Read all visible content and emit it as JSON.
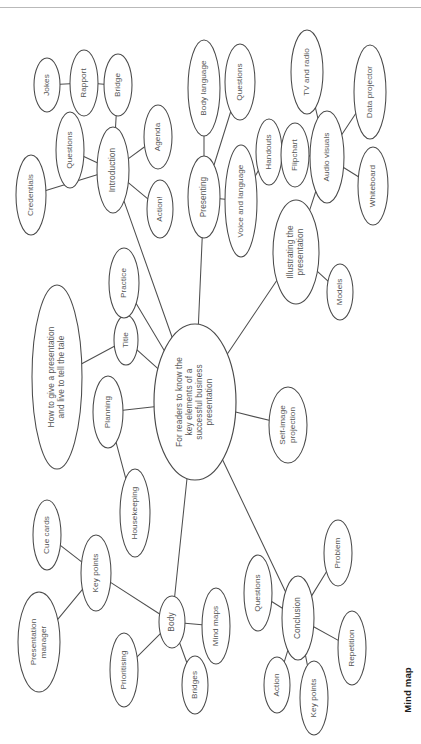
{
  "figure": {
    "caption": "Mind map",
    "rotation_note": "page content rotated 90 degrees",
    "colors": {
      "background": "#ffffff",
      "stroke": "#4a4a4a",
      "text": "#555555",
      "caption_text": "#1d1d1d",
      "rule": "#b9b9b9"
    }
  },
  "mind_map": {
    "central_topic": "For readers to know the key elements of a successful business presentation",
    "nodes": [
      {
        "id": "center",
        "label": "For readers to know the\nkey elements of a\nsuccessful business\npresentation",
        "cx": 195,
        "cy": 402,
        "rx": 41,
        "ry": 78,
        "kind": "central"
      },
      {
        "id": "howto",
        "label": "How to give a presentation\nand live to tell the tale",
        "cx": 57,
        "cy": 377,
        "rx": 25,
        "ry": 92,
        "kind": "major"
      },
      {
        "id": "title",
        "label": "Title",
        "cx": 126,
        "cy": 340,
        "rx": 12,
        "ry": 25,
        "kind": "leaf"
      },
      {
        "id": "practice",
        "label": "Practice",
        "cx": 124,
        "cy": 283,
        "rx": 15,
        "ry": 35,
        "kind": "leaf"
      },
      {
        "id": "planning",
        "label": "Planning",
        "cx": 108,
        "cy": 412,
        "rx": 15,
        "ry": 36,
        "kind": "leaf"
      },
      {
        "id": "housekeeping",
        "label": "Housekeeping",
        "cx": 135,
        "cy": 513,
        "rx": 15,
        "ry": 44,
        "kind": "leaf"
      },
      {
        "id": "introduction",
        "label": "Introduction",
        "cx": 113,
        "cy": 170,
        "rx": 16,
        "ry": 43,
        "kind": "major"
      },
      {
        "id": "bridge",
        "label": "Bridge",
        "cx": 118,
        "cy": 85,
        "rx": 14,
        "ry": 31,
        "kind": "leaf"
      },
      {
        "id": "rapport",
        "label": "Rapport",
        "cx": 84,
        "cy": 83,
        "rx": 14,
        "ry": 33,
        "kind": "leaf"
      },
      {
        "id": "jokes",
        "label": "Jokes",
        "cx": 47,
        "cy": 85,
        "rx": 13,
        "ry": 27,
        "kind": "leaf"
      },
      {
        "id": "questions-intro",
        "label": "Questions",
        "cx": 70,
        "cy": 150,
        "rx": 14,
        "ry": 38,
        "kind": "leaf"
      },
      {
        "id": "credentials",
        "label": "Credentials",
        "cx": 31,
        "cy": 195,
        "rx": 15,
        "ry": 40,
        "kind": "leaf"
      },
      {
        "id": "agenda",
        "label": "Agenda",
        "cx": 158,
        "cy": 137,
        "rx": 14,
        "ry": 32,
        "kind": "leaf"
      },
      {
        "id": "action-intro",
        "label": "Action!",
        "cx": 160,
        "cy": 209,
        "rx": 13,
        "ry": 29,
        "kind": "leaf"
      },
      {
        "id": "presenting",
        "label": "Presenting",
        "cx": 204,
        "cy": 197,
        "rx": 16,
        "ry": 41,
        "kind": "major"
      },
      {
        "id": "body-language",
        "label": "Body language",
        "cx": 204,
        "cy": 88,
        "rx": 16,
        "ry": 48,
        "kind": "leaf"
      },
      {
        "id": "questions-present",
        "label": "Questions",
        "cx": 240,
        "cy": 82,
        "rx": 15,
        "ry": 38,
        "kind": "leaf"
      },
      {
        "id": "voice",
        "label": "Voice and language",
        "cx": 241,
        "cy": 201,
        "rx": 16,
        "ry": 56,
        "kind": "leaf"
      },
      {
        "id": "handouts",
        "label": "Handouts",
        "cx": 269,
        "cy": 152,
        "rx": 13,
        "ry": 33,
        "kind": "leaf"
      },
      {
        "id": "illustrating",
        "label": "Illustrating the\npresentation",
        "cx": 296,
        "cy": 252,
        "rx": 23,
        "ry": 52,
        "kind": "major"
      },
      {
        "id": "models",
        "label": "Models",
        "cx": 340,
        "cy": 292,
        "rx": 13,
        "ry": 28,
        "kind": "leaf"
      },
      {
        "id": "audio-visuals",
        "label": "Audio visuals",
        "cx": 327,
        "cy": 157,
        "rx": 17,
        "ry": 46,
        "kind": "leaf"
      },
      {
        "id": "flipchart",
        "label": "Flipchart",
        "cx": 295,
        "cy": 155,
        "rx": 14,
        "ry": 32,
        "kind": "leaf"
      },
      {
        "id": "tv-radio",
        "label": "TV and radio",
        "cx": 307,
        "cy": 72,
        "rx": 16,
        "ry": 42,
        "kind": "leaf"
      },
      {
        "id": "data-projector",
        "label": "Data projector",
        "cx": 370,
        "cy": 92,
        "rx": 16,
        "ry": 47,
        "kind": "leaf"
      },
      {
        "id": "whiteboard",
        "label": "Whiteboard",
        "cx": 373,
        "cy": 186,
        "rx": 15,
        "ry": 39,
        "kind": "leaf"
      },
      {
        "id": "self-image",
        "label": "Self-image\nprojection",
        "cx": 288,
        "cy": 425,
        "rx": 19,
        "ry": 38,
        "kind": "leaf"
      },
      {
        "id": "body",
        "label": "Body",
        "cx": 172,
        "cy": 622,
        "rx": 13,
        "ry": 26,
        "kind": "major"
      },
      {
        "id": "mind-maps",
        "label": "Mind maps",
        "cx": 216,
        "cy": 626,
        "rx": 14,
        "ry": 38,
        "kind": "leaf"
      },
      {
        "id": "bridges",
        "label": "Bridges",
        "cx": 195,
        "cy": 685,
        "rx": 13,
        "ry": 29,
        "kind": "leaf"
      },
      {
        "id": "prioritising",
        "label": "Prioritising",
        "cx": 124,
        "cy": 670,
        "rx": 14,
        "ry": 37,
        "kind": "leaf"
      },
      {
        "id": "key-points-body",
        "label": "Key points",
        "cx": 96,
        "cy": 573,
        "rx": 15,
        "ry": 38,
        "kind": "leaf"
      },
      {
        "id": "cue-cards",
        "label": "Cue cards",
        "cx": 47,
        "cy": 535,
        "rx": 14,
        "ry": 35,
        "kind": "leaf"
      },
      {
        "id": "presentation-manager",
        "label": "Presentation\nmanager",
        "cx": 39,
        "cy": 642,
        "rx": 21,
        "ry": 50,
        "kind": "leaf"
      },
      {
        "id": "conclusion",
        "label": "Conclusion",
        "cx": 298,
        "cy": 618,
        "rx": 16,
        "ry": 42,
        "kind": "major"
      },
      {
        "id": "questions-conclusion",
        "label": "Questions",
        "cx": 258,
        "cy": 593,
        "rx": 14,
        "ry": 38,
        "kind": "leaf"
      },
      {
        "id": "problem",
        "label": "Problem",
        "cx": 338,
        "cy": 553,
        "rx": 14,
        "ry": 33,
        "kind": "leaf"
      },
      {
        "id": "repetition",
        "label": "Repetition",
        "cx": 352,
        "cy": 648,
        "rx": 14,
        "ry": 37,
        "kind": "leaf"
      },
      {
        "id": "action-conclusion",
        "label": "Action",
        "cx": 277,
        "cy": 685,
        "rx": 13,
        "ry": 28,
        "kind": "leaf"
      },
      {
        "id": "key-points-conclusion",
        "label": "Key points",
        "cx": 314,
        "cy": 698,
        "rx": 14,
        "ry": 37,
        "kind": "leaf"
      }
    ],
    "edges": [
      {
        "from": "center",
        "to": "introduction"
      },
      {
        "from": "center",
        "to": "presenting"
      },
      {
        "from": "center",
        "to": "illustrating"
      },
      {
        "from": "center",
        "to": "self-image"
      },
      {
        "from": "center",
        "to": "planning"
      },
      {
        "from": "center",
        "to": "title"
      },
      {
        "from": "center",
        "to": "practice"
      },
      {
        "from": "center",
        "to": "body"
      },
      {
        "from": "center",
        "to": "conclusion"
      },
      {
        "from": "howto",
        "to": "title"
      },
      {
        "from": "planning",
        "to": "housekeeping"
      },
      {
        "from": "introduction",
        "to": "bridge"
      },
      {
        "from": "introduction",
        "to": "questions-intro"
      },
      {
        "from": "introduction",
        "to": "credentials"
      },
      {
        "from": "introduction",
        "to": "agenda"
      },
      {
        "from": "introduction",
        "to": "action-intro"
      },
      {
        "from": "rapport",
        "to": "jokes"
      },
      {
        "from": "rapport",
        "to": "bridge"
      },
      {
        "from": "presenting",
        "to": "body-language"
      },
      {
        "from": "presenting",
        "to": "questions-present"
      },
      {
        "from": "presenting",
        "to": "voice"
      },
      {
        "from": "voice",
        "to": "handouts"
      },
      {
        "from": "illustrating",
        "to": "audio-visuals"
      },
      {
        "from": "illustrating",
        "to": "models"
      },
      {
        "from": "audio-visuals",
        "to": "flipchart"
      },
      {
        "from": "audio-visuals",
        "to": "tv-radio"
      },
      {
        "from": "audio-visuals",
        "to": "data-projector"
      },
      {
        "from": "audio-visuals",
        "to": "whiteboard"
      },
      {
        "from": "body",
        "to": "mind-maps"
      },
      {
        "from": "body",
        "to": "bridges"
      },
      {
        "from": "body",
        "to": "prioritising"
      },
      {
        "from": "body",
        "to": "key-points-body"
      },
      {
        "from": "key-points-body",
        "to": "cue-cards"
      },
      {
        "from": "key-points-body",
        "to": "presentation-manager"
      },
      {
        "from": "conclusion",
        "to": "questions-conclusion"
      },
      {
        "from": "conclusion",
        "to": "problem"
      },
      {
        "from": "conclusion",
        "to": "repetition"
      },
      {
        "from": "conclusion",
        "to": "action-conclusion"
      },
      {
        "from": "conclusion",
        "to": "key-points-conclusion"
      }
    ]
  }
}
